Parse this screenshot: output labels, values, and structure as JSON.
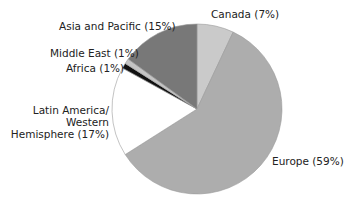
{
  "chart_data": {
    "type": "pie",
    "title": "",
    "start_angle_deg": 0,
    "direction": "clockwise",
    "slices": [
      {
        "label": "Canada",
        "value": 7,
        "display": "Canada (7%)",
        "color": "#cacaca"
      },
      {
        "label": "Europe",
        "value": 59,
        "display": "Europe (59%)",
        "color": "#adadad"
      },
      {
        "label": "Latin America/ Western Hemisphere",
        "value": 17,
        "display_lines": [
          "Latin America/",
          "Western",
          "Hemisphere (17%)"
        ],
        "color": "#ffffff"
      },
      {
        "label": "Africa",
        "value": 1,
        "display": "Africa (1%)",
        "color": "#111111"
      },
      {
        "label": "Middle East",
        "value": 1,
        "display": "Middle East (1%)",
        "color": "#c4c4c4"
      },
      {
        "label": "Asia and Pacific",
        "value": 15,
        "display": "Asia and Pacific (15%)",
        "color": "#787878"
      }
    ],
    "legend": "none (direct labels)"
  },
  "labels": {
    "canada": "Canada (7%)",
    "europe": "Europe (59%)",
    "latam_1": "Latin America/",
    "latam_2": "Western",
    "latam_3": "Hemisphere (17%)",
    "africa": "Africa (1%)",
    "middle_east": "Middle East (1%)",
    "asia": "Asia and Pacific (15%)"
  }
}
